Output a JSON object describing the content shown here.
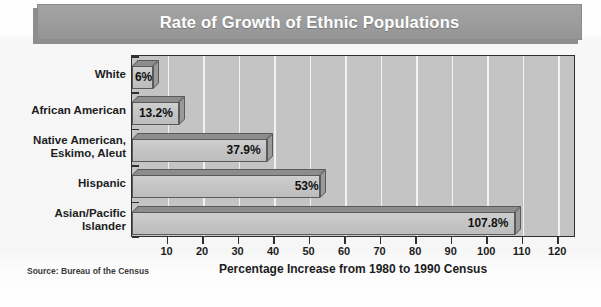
{
  "title": "Rate of Growth of Ethnic Populations",
  "source_note": "Source: Bureau of the Census",
  "chart_data": {
    "type": "bar",
    "orientation": "horizontal",
    "title": "Rate of Growth of Ethnic Populations",
    "xlabel": "Percentage Increase from 1980 to 1990 Census",
    "ylabel": "",
    "categories": [
      "White",
      "African American",
      "Native American,\nEskimo, Aleut",
      "Hispanic",
      "Asian/Pacific\nIslander"
    ],
    "values": [
      6,
      13.2,
      37.9,
      53,
      107.8
    ],
    "data_labels": [
      "6%",
      "13.2%",
      "37.9%",
      "53%",
      "107.8%"
    ],
    "xlim": [
      0,
      125
    ],
    "xticks": [
      10,
      20,
      30,
      40,
      50,
      60,
      70,
      80,
      90,
      100,
      110,
      120
    ],
    "xtick_labels": [
      "10",
      "20",
      "30",
      "40",
      "50",
      "60",
      "70",
      "80",
      "90",
      "100",
      "110",
      "120"
    ],
    "grid": "vertical",
    "legend": "none",
    "colors": {
      "plot_background": "#c4c4c4",
      "bar_face": "#c6c6c6",
      "bar_top": "#8d8d8d",
      "bar_side": "#9a9a9a",
      "bar_outline": "#5a5a5a",
      "gridline": "#f2f2f2",
      "axis": "#2f2f2f",
      "title_bar": "#9c9c9c",
      "title_text": "#ffffff",
      "page_background": "#fbfbfb"
    }
  },
  "categories_display": [
    {
      "line1": "White",
      "line2": ""
    },
    {
      "line1": "African American",
      "line2": ""
    },
    {
      "line1": "Native American,",
      "line2": "Eskimo, Aleut"
    },
    {
      "line1": "Hispanic",
      "line2": ""
    },
    {
      "line1": "Asian/Pacific",
      "line2": "Islander"
    }
  ]
}
